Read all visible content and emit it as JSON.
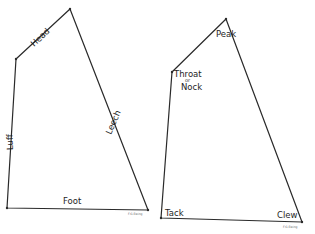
{
  "diagram": {
    "title": "",
    "colors": {
      "line": "#2a2a2a",
      "text": "#1e1e1e",
      "background": "#ffffff"
    },
    "sails": [
      {
        "id": "left-sail",
        "vertices": {
          "head": [
            70,
            9
          ],
          "throat": [
            16,
            59
          ],
          "tack": [
            7,
            208
          ],
          "clew": [
            148,
            210
          ]
        },
        "edge_labels": {
          "head": "Head",
          "luff": "Luff",
          "leech": "Leech",
          "foot": "Foot"
        },
        "signature": "F.G.Ewing"
      },
      {
        "id": "right-sail",
        "vertices": {
          "peak": [
            226,
            19
          ],
          "throat": [
            172,
            72
          ],
          "tack": [
            161,
            218
          ],
          "clew": [
            302,
            222
          ]
        },
        "corner_labels": {
          "peak": "Peak",
          "throat": "Throat",
          "or": "or",
          "nock": "Nock",
          "tack": "Tack",
          "clew": "Clew"
        },
        "signature": "F.G.Ewing"
      }
    ]
  }
}
